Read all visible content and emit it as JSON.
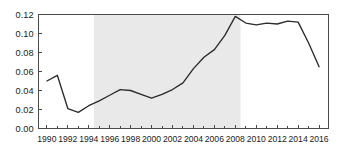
{
  "chart_data": {
    "type": "line",
    "title": "",
    "subtitle": "",
    "xlabel": "",
    "ylabel": "",
    "xlim": [
      1989.2,
      2016.9
    ],
    "ylim": [
      0.0,
      0.12
    ],
    "grid": false,
    "legend": false,
    "legend_position": "none",
    "x_tick_labels": [
      "1990",
      "1992",
      "1994",
      "1996",
      "1998",
      "2000",
      "2002",
      "2004",
      "2006",
      "2008",
      "2010",
      "2012",
      "2014",
      "2016"
    ],
    "x_tick_values": [
      1990,
      1992,
      1994,
      1996,
      1998,
      2000,
      2002,
      2004,
      2006,
      2008,
      2010,
      2012,
      2014,
      2016
    ],
    "x_minor_tick_values": [
      1991,
      1993,
      1995,
      1997,
      1999,
      2001,
      2003,
      2005,
      2007,
      2009,
      2011,
      2013,
      2015
    ],
    "y_tick_labels": [
      "0.00",
      "0.02",
      "0.04",
      "0.06",
      "0.08",
      "0.10",
      "0.12"
    ],
    "y_tick_values": [
      0.0,
      0.02,
      0.04,
      0.06,
      0.08,
      0.1,
      0.12
    ],
    "x": [
      1990,
      1991,
      1992,
      1993,
      1994,
      1995,
      1996,
      1997,
      1998,
      1999,
      2000,
      2001,
      2002,
      2003,
      2004,
      2005,
      2006,
      2007,
      2008,
      2009,
      2010,
      2011,
      2012,
      2013,
      2014,
      2015,
      2016
    ],
    "values": [
      0.05,
      0.056,
      0.021,
      0.017,
      0.024,
      0.029,
      0.035,
      0.041,
      0.04,
      0.036,
      0.032,
      0.036,
      0.041,
      0.048,
      0.063,
      0.075,
      0.083,
      0.098,
      0.118,
      0.111,
      0.109,
      0.111,
      0.11,
      0.113,
      0.112,
      0.09,
      0.065
    ],
    "series": [
      {
        "name": "series-1",
        "color": "#2b2b2b",
        "values": [
          0.05,
          0.056,
          0.021,
          0.017,
          0.024,
          0.029,
          0.035,
          0.041,
          0.04,
          0.036,
          0.032,
          0.036,
          0.041,
          0.048,
          0.063,
          0.075,
          0.083,
          0.098,
          0.118,
          0.111,
          0.109,
          0.111,
          0.11,
          0.113,
          0.112,
          0.09,
          0.065
        ]
      }
    ],
    "shaded_regions": [
      {
        "name": "highlight-band",
        "x_start": 1994.5,
        "x_end": 2008.5,
        "color": "#e9e9e9"
      }
    ],
    "axis_color": "#4a4a4a",
    "line_color": "#2b2b2b",
    "background_color": "#ffffff"
  }
}
